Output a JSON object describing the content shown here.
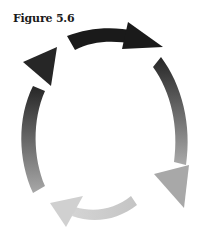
{
  "figure": {
    "title": "Figure 5.6",
    "diagram_type": "cycle",
    "direction": "clockwise",
    "arrows": [
      {
        "position": "top",
        "color_start": "#1a1a1a",
        "color_end": "#1a1a1a"
      },
      {
        "position": "right",
        "color_start": "#2a2a2a",
        "color_end": "#a8a8a8"
      },
      {
        "position": "bottom",
        "color_start": "#bdbdbd",
        "color_end": "#d6d6d6"
      },
      {
        "position": "left",
        "color_start": "#a0a0a0",
        "color_end": "#2a2a2a"
      }
    ]
  }
}
